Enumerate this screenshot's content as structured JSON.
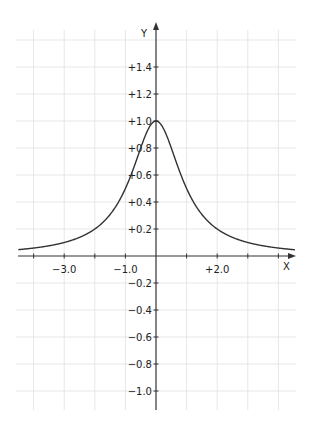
{
  "chart_data": {
    "type": "line",
    "title": "",
    "function": "y = 1 / (1 + x^2)",
    "xlabel": "X",
    "ylabel": "Y",
    "xlim": [
      -4.0,
      4.5
    ],
    "ylim": [
      -1.1,
      1.6
    ],
    "grid": true,
    "x_ticks": [
      -4,
      -3,
      -2,
      -1,
      0,
      1,
      2,
      3,
      4
    ],
    "x_tick_labels": [
      {
        "value": -3,
        "label": "−3.0"
      },
      {
        "value": -1,
        "label": "−1.0"
      },
      {
        "value": 2,
        "label": "+2.0"
      }
    ],
    "y_tick_labels": [
      {
        "value": 1.4,
        "label": "+1.4"
      },
      {
        "value": 1.2,
        "label": "+1.2"
      },
      {
        "value": 1.0,
        "label": "+1.0"
      },
      {
        "value": 0.8,
        "label": "+0.8"
      },
      {
        "value": 0.6,
        "label": "+0.6"
      },
      {
        "value": 0.4,
        "label": "+0.4"
      },
      {
        "value": 0.2,
        "label": "+0.2"
      },
      {
        "value": -0.2,
        "label": "−0.2"
      },
      {
        "value": -0.4,
        "label": "−0.4"
      },
      {
        "value": -0.6,
        "label": "−0.6"
      },
      {
        "value": -0.8,
        "label": "−0.8"
      },
      {
        "value": -1.0,
        "label": "−1.0"
      }
    ],
    "series": [
      {
        "name": "1/(1+x^2)",
        "x": [
          -4.0,
          -3.0,
          -2.0,
          -1.5,
          -1.0,
          -0.5,
          0.0,
          0.5,
          1.0,
          1.5,
          2.0,
          3.0,
          4.0,
          4.5
        ],
        "values": [
          0.059,
          0.1,
          0.2,
          0.308,
          0.5,
          0.8,
          1.0,
          0.8,
          0.5,
          0.308,
          0.2,
          0.1,
          0.059,
          0.047
        ]
      }
    ],
    "colors": {
      "curve": "#333333",
      "axis": "#333333",
      "grid": "#dddddd"
    }
  }
}
